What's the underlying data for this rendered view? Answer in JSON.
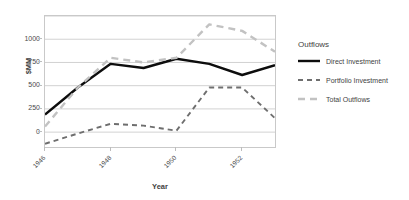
{
  "chart_data": {
    "type": "line",
    "title": "",
    "xlabel": "Year",
    "ylabel": "$MM",
    "x": [
      1946,
      1947,
      1948,
      1949,
      1950,
      1951,
      1952,
      1953
    ],
    "categories": [
      "1946",
      "1947",
      "1948",
      "1949",
      "1950",
      "1951",
      "1952",
      "1953"
    ],
    "xtick_labels": [
      "1946",
      "1948",
      "1950",
      "1952"
    ],
    "xtick_values": [
      1946,
      1948,
      1950,
      1952
    ],
    "ytick_labels": [
      "0",
      "250",
      "500",
      "750",
      "1000"
    ],
    "ytick_values": [
      0,
      250,
      500,
      750,
      1000
    ],
    "xlim": [
      1946,
      1953
    ],
    "ylim": [
      -160,
      1250
    ],
    "grid": "horizontal",
    "legend_position": "right",
    "legend_title": "Outflows",
    "series": [
      {
        "name": "Direct Investment",
        "style": "solid",
        "color": "#0d0d0d",
        "values": [
          190,
          480,
          735,
          690,
          790,
          735,
          615,
          720
        ]
      },
      {
        "name": "Portfolio Investment",
        "style": "dashed",
        "color": "#6e6e6e",
        "values": [
          -125,
          -15,
          90,
          70,
          15,
          480,
          480,
          150
        ]
      },
      {
        "name": "Total Outflows",
        "style": "dashed",
        "color": "#c2c2c2",
        "values": [
          60,
          480,
          800,
          750,
          800,
          1160,
          1090,
          865
        ]
      }
    ]
  },
  "axes": {
    "y_title": "$MM",
    "x_title": "Year"
  },
  "legend": {
    "title": "Outflows",
    "items": [
      {
        "label": "Direct Investment"
      },
      {
        "label": "Portfolio Investment"
      },
      {
        "label": "Total Outflows"
      }
    ]
  },
  "colors": {
    "direct_investment": "#0d0d0d",
    "portfolio_investment": "#6e6e6e",
    "total_outflows": "#c2c2c2",
    "gridline": "#d2d2d2",
    "axis_border": "#c9c9c9",
    "text": "#3f3f3f",
    "background": "#ffffff"
  }
}
